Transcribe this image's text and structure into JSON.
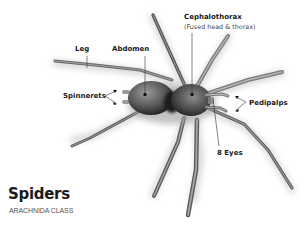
{
  "diagram": {
    "type": "labeled-anatomy-illustration",
    "subject": "spider",
    "colors": {
      "background": "#ffffff",
      "label_text": "#1a1a1a",
      "subtitle_text": "#555555",
      "leader_line": "#333333",
      "body_light": "#8a8a8a",
      "body_dark": "#1e1e1e"
    }
  },
  "title": {
    "main": "Spiders",
    "class": "ARACHNIDA CLASS"
  },
  "labels": {
    "leg": "Leg",
    "abdomen": "Abdomen",
    "cephalothorax": "Cephalothorax",
    "cephalothorax_note": "(Fused head & thorax)",
    "spinnerets": "Spinnerets",
    "pedipalps": "Pedipalps",
    "eyes": "8 Eyes"
  }
}
